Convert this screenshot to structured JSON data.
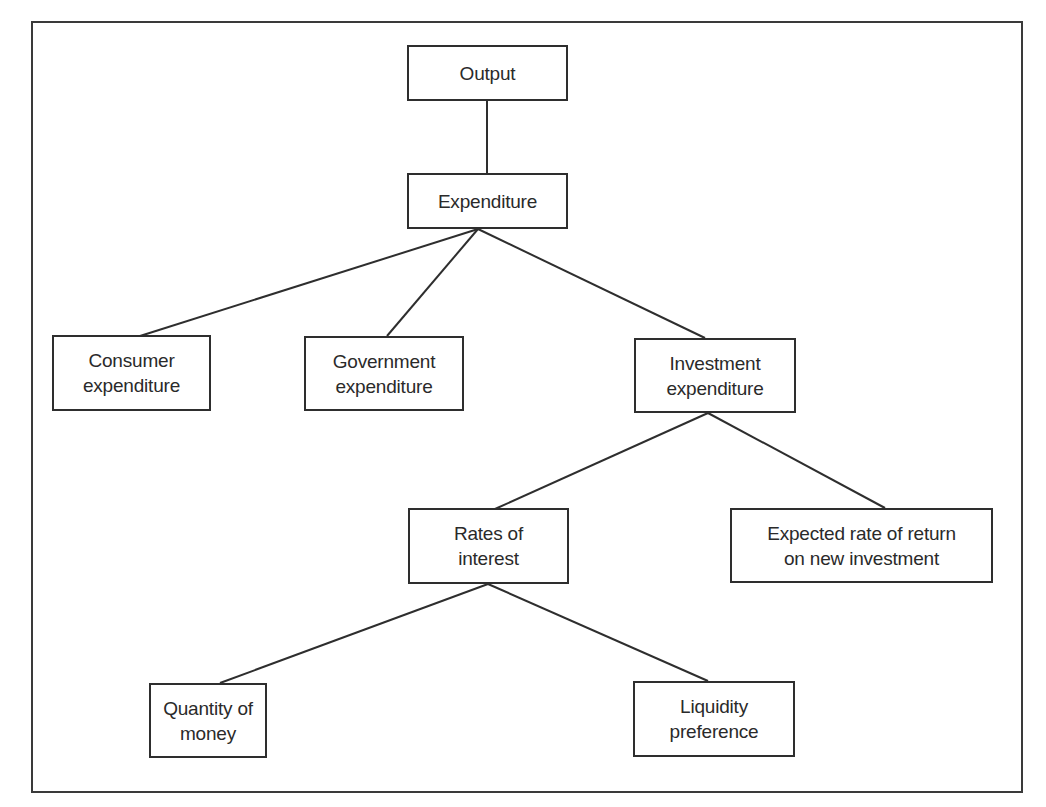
{
  "diagram": {
    "type": "tree",
    "frame": {
      "x": 31,
      "y": 21,
      "width": 992,
      "height": 772
    },
    "line_color": "#2e2e2e",
    "text_color": "#2a2a2a",
    "nodes": {
      "output": {
        "lines": [
          "Output"
        ],
        "x": 407,
        "y": 45,
        "w": 161,
        "h": 56
      },
      "expenditure": {
        "lines": [
          "Expenditure"
        ],
        "x": 407,
        "y": 173,
        "w": 161,
        "h": 56
      },
      "consumer": {
        "lines": [
          "Consumer",
          "expenditure"
        ],
        "x": 52,
        "y": 335,
        "w": 159,
        "h": 76
      },
      "government": {
        "lines": [
          "Government",
          "expenditure"
        ],
        "x": 304,
        "y": 336,
        "w": 160,
        "h": 75
      },
      "investment": {
        "lines": [
          "Investment",
          "expenditure"
        ],
        "x": 634,
        "y": 338,
        "w": 162,
        "h": 75
      },
      "rates": {
        "lines": [
          "Rates of",
          "interest"
        ],
        "x": 408,
        "y": 508,
        "w": 161,
        "h": 76
      },
      "expected": {
        "lines": [
          "Expected rate of return",
          "on new investment"
        ],
        "x": 730,
        "y": 508,
        "w": 263,
        "h": 75
      },
      "quantity": {
        "lines": [
          "Quantity of",
          "money"
        ],
        "x": 149,
        "y": 683,
        "w": 118,
        "h": 75
      },
      "liquidity": {
        "lines": [
          "Liquidity",
          "preference"
        ],
        "x": 633,
        "y": 681,
        "w": 162,
        "h": 76
      }
    },
    "edges": [
      {
        "from": "output",
        "to": "expenditure",
        "x1": 487,
        "y1": 101,
        "x2": 487,
        "y2": 173
      },
      {
        "from": "expenditure",
        "to": "consumer",
        "x1": 478,
        "y1": 229,
        "x2": 140,
        "y2": 336
      },
      {
        "from": "expenditure",
        "to": "government",
        "x1": 478,
        "y1": 229,
        "x2": 387,
        "y2": 336
      },
      {
        "from": "expenditure",
        "to": "investment",
        "x1": 478,
        "y1": 229,
        "x2": 705,
        "y2": 338
      },
      {
        "from": "investment",
        "to": "rates",
        "x1": 708,
        "y1": 413,
        "x2": 495,
        "y2": 509
      },
      {
        "from": "investment",
        "to": "expected",
        "x1": 708,
        "y1": 413,
        "x2": 885,
        "y2": 508
      },
      {
        "from": "rates",
        "to": "quantity",
        "x1": 488,
        "y1": 584,
        "x2": 220,
        "y2": 683
      },
      {
        "from": "rates",
        "to": "liquidity",
        "x1": 488,
        "y1": 584,
        "x2": 708,
        "y2": 681
      }
    ]
  }
}
